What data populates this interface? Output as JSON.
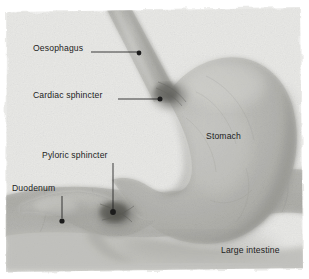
{
  "figure": {
    "medium": "pencil illustration on textured paper",
    "width": 309,
    "height": 279,
    "background_color": "#ffffff",
    "paper_color": "#e9e9e7",
    "organ_color": "#b9b9b5",
    "shadow_color": "#6f6f6c",
    "label_color": "#1c1c1c",
    "leader_color": "#1c1c1c"
  },
  "labels": [
    {
      "id": "oesophagus",
      "text": "Oesophagus",
      "x": 33,
      "y": 44,
      "leader": {
        "type": "horizontal",
        "x1": 91,
        "y1": 52,
        "x2": 137,
        "y2": 52
      },
      "dot": {
        "x": 139,
        "y": 53,
        "r": 2.4
      }
    },
    {
      "id": "cardiac-sphincter",
      "text": "Cardiac sphincter",
      "x": 33,
      "y": 91,
      "leader": {
        "type": "horizontal",
        "x1": 118,
        "y1": 99,
        "x2": 158,
        "y2": 99
      },
      "dot": {
        "x": 160,
        "y": 99,
        "r": 2.5
      }
    },
    {
      "id": "pyloric-sphincter",
      "text": "Pyloric sphincter",
      "x": 42,
      "y": 151,
      "leader": {
        "type": "vertical",
        "x1": 113,
        "y1": 163,
        "x2": 113,
        "y2": 209
      },
      "dot": {
        "x": 113,
        "y": 212,
        "r": 2.9
      }
    },
    {
      "id": "duodenum",
      "text": "Duodenum",
      "x": 12,
      "y": 184,
      "leader": {
        "type": "vertical",
        "x1": 62,
        "y1": 196,
        "x2": 62,
        "y2": 218
      },
      "dot": {
        "x": 62,
        "y": 221,
        "r": 2.6
      }
    },
    {
      "id": "stomach",
      "text": "Stomach",
      "x": 206,
      "y": 132,
      "leader": null,
      "dot": null
    },
    {
      "id": "large-intestine",
      "text": "Large intestine",
      "x": 221,
      "y": 246,
      "leader": null,
      "dot": null
    }
  ],
  "structures": [
    {
      "id": "oesophagus-tube",
      "name": "Oesophagus"
    },
    {
      "id": "stomach-body",
      "name": "Stomach"
    },
    {
      "id": "cardiac-notch",
      "name": "Cardiac sphincter"
    },
    {
      "id": "pyloric-region",
      "name": "Pyloric sphincter"
    },
    {
      "id": "duodenum-tube",
      "name": "Duodenum"
    },
    {
      "id": "large-intestine-band",
      "name": "Large intestine"
    }
  ]
}
